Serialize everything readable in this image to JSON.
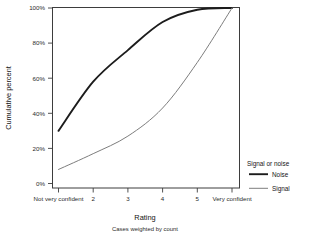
{
  "chart_data": {
    "type": "line",
    "title": "",
    "xlabel": "Rating",
    "ylabel": "Cumulative percent",
    "subtitle": "Cases weighted by count",
    "categories": [
      "Not very confident",
      "2",
      "3",
      "4",
      "5",
      "Very confident"
    ],
    "x": [
      1,
      2,
      3,
      4,
      5,
      6
    ],
    "ylim": [
      0,
      100
    ],
    "ytick_values": [
      0,
      20,
      40,
      60,
      80,
      100
    ],
    "ytick_labels": [
      "0%",
      "20%",
      "40%",
      "60%",
      "80%",
      "100%"
    ],
    "grid": false,
    "legend_position": "right",
    "legend_title": "Signal or noise",
    "series": [
      {
        "name": "Noise",
        "color": "#1c1c1c",
        "width": 1.9,
        "values": [
          30,
          58,
          76,
          92,
          99,
          100
        ]
      },
      {
        "name": "Signal",
        "color": "#7d7d7d",
        "width": 1.0,
        "values": [
          8,
          17,
          27,
          43,
          69,
          100
        ]
      }
    ]
  },
  "axes": {
    "ylabel": "Cumulative percent",
    "xlabel": "Rating",
    "footnote": "Cases weighted by count",
    "ytick_labels": [
      "100%",
      "80%",
      "60%",
      "40%",
      "20%",
      "0%"
    ],
    "xtick_labels": [
      "Not very confident",
      "2",
      "3",
      "4",
      "5",
      "Very confident"
    ]
  },
  "legend": {
    "title": "Signal or noise",
    "items": [
      {
        "label": "Noise",
        "color": "#1c1c1c"
      },
      {
        "label": "Signal",
        "color": "#7d7d7d"
      }
    ]
  }
}
